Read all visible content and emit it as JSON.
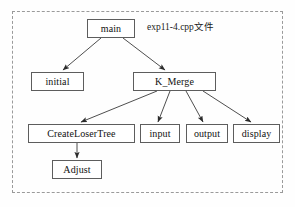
{
  "diagram": {
    "frame": {
      "style": "dashed",
      "color": "#9a9a9a"
    },
    "file_label": "exp11-4.cpp文件",
    "node_border_color": "#5d5d5d",
    "node_fill_color": "#ffffff",
    "edge_color": "#3a3a3a",
    "nodes": [
      {
        "id": "main",
        "label": "main"
      },
      {
        "id": "initial",
        "label": "initial"
      },
      {
        "id": "k_merge",
        "label": "K_Merge"
      },
      {
        "id": "createlosertree",
        "label": "CreateLoserTree"
      },
      {
        "id": "input",
        "label": "input"
      },
      {
        "id": "output",
        "label": "output"
      },
      {
        "id": "display",
        "label": "display"
      },
      {
        "id": "adjust",
        "label": "Adjust"
      }
    ],
    "edges": [
      {
        "from": "main",
        "to": "initial"
      },
      {
        "from": "main",
        "to": "k_merge"
      },
      {
        "from": "k_merge",
        "to": "createlosertree"
      },
      {
        "from": "k_merge",
        "to": "input"
      },
      {
        "from": "k_merge",
        "to": "output"
      },
      {
        "from": "k_merge",
        "to": "display"
      },
      {
        "from": "createlosertree",
        "to": "adjust"
      }
    ]
  }
}
